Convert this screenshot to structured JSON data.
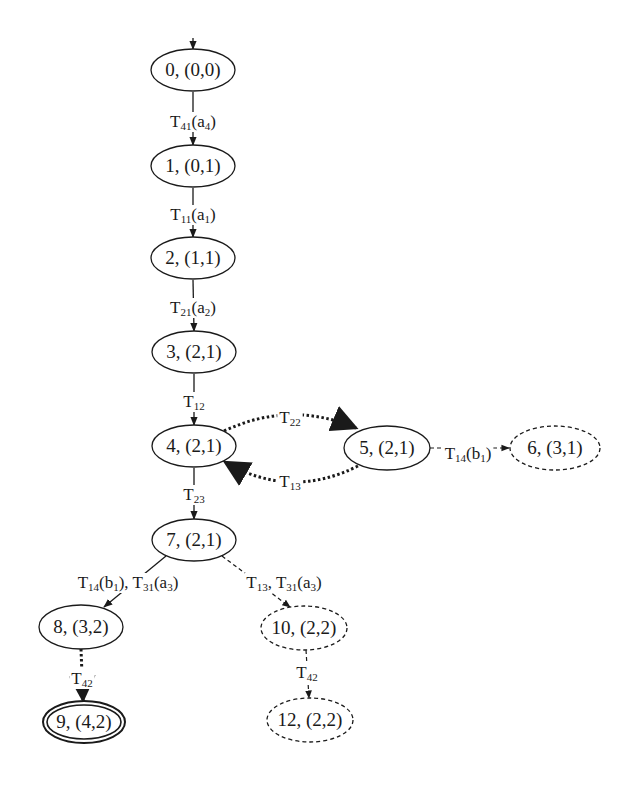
{
  "title": "",
  "colors": {
    "ink": "#1a1a1a",
    "background": "#ffffff"
  },
  "nodes": [
    {
      "id": "0",
      "label": "0, (0,0)",
      "style": "solid",
      "initial": true,
      "final": false
    },
    {
      "id": "1",
      "label": "1, (0,1)",
      "style": "solid",
      "initial": false,
      "final": false
    },
    {
      "id": "2",
      "label": "2, (1,1)",
      "style": "solid",
      "initial": false,
      "final": false
    },
    {
      "id": "3",
      "label": "3, (2,1)",
      "style": "solid",
      "initial": false,
      "final": false
    },
    {
      "id": "4",
      "label": "4, (2,1)",
      "style": "solid",
      "initial": false,
      "final": false
    },
    {
      "id": "5",
      "label": "5, (2,1)",
      "style": "solid",
      "initial": false,
      "final": false
    },
    {
      "id": "6",
      "label": "6, (3,1)",
      "style": "dashed",
      "initial": false,
      "final": false
    },
    {
      "id": "7",
      "label": "7, (2,1)",
      "style": "solid",
      "initial": false,
      "final": false
    },
    {
      "id": "8",
      "label": "8, (3,2)",
      "style": "solid",
      "initial": false,
      "final": false
    },
    {
      "id": "9",
      "label": "9, (4,2)",
      "style": "double",
      "initial": false,
      "final": true
    },
    {
      "id": "10",
      "label": "10, (2,2)",
      "style": "dashed",
      "initial": false,
      "final": false
    },
    {
      "id": "12",
      "label": "12, (2,2)",
      "style": "dashed",
      "initial": false,
      "final": false
    }
  ],
  "edges": [
    {
      "from": "0",
      "to": "1",
      "style": "solid",
      "label": [
        [
          "T",
          ""
        ],
        [
          "41",
          "sub"
        ],
        [
          "(a",
          ""
        ],
        [
          "4",
          "sub"
        ],
        [
          ")",
          ""
        ]
      ]
    },
    {
      "from": "1",
      "to": "2",
      "style": "solid",
      "label": [
        [
          "T",
          ""
        ],
        [
          "11",
          "sub"
        ],
        [
          "(a",
          ""
        ],
        [
          "1",
          "sub"
        ],
        [
          ")",
          ""
        ]
      ]
    },
    {
      "from": "2",
      "to": "3",
      "style": "solid",
      "label": [
        [
          "T",
          ""
        ],
        [
          "21",
          "sub"
        ],
        [
          "(a",
          ""
        ],
        [
          "2",
          "sub"
        ],
        [
          ")",
          ""
        ]
      ]
    },
    {
      "from": "3",
      "to": "4",
      "style": "solid",
      "label": [
        [
          "T",
          ""
        ],
        [
          "12",
          "sub"
        ]
      ]
    },
    {
      "from": "4",
      "to": "5",
      "style": "dotted",
      "label": [
        [
          "T",
          ""
        ],
        [
          "22",
          "sub"
        ]
      ]
    },
    {
      "from": "5",
      "to": "4",
      "style": "dotted",
      "label": [
        [
          "T",
          ""
        ],
        [
          "13",
          "sub"
        ]
      ]
    },
    {
      "from": "5",
      "to": "6",
      "style": "dashed",
      "label": [
        [
          "T",
          ""
        ],
        [
          "14",
          "sub"
        ],
        [
          "(b",
          ""
        ],
        [
          "1",
          "sub"
        ],
        [
          ")",
          ""
        ]
      ]
    },
    {
      "from": "4",
      "to": "7",
      "style": "solid",
      "label": [
        [
          "T",
          ""
        ],
        [
          "23",
          "sub"
        ]
      ]
    },
    {
      "from": "7",
      "to": "8",
      "style": "solid",
      "label": [
        [
          "T",
          ""
        ],
        [
          "14",
          "sub"
        ],
        [
          "(b",
          ""
        ],
        [
          "1",
          "sub"
        ],
        [
          "), T",
          ""
        ],
        [
          "31",
          "sub"
        ],
        [
          "(a",
          ""
        ],
        [
          "3",
          "sub"
        ],
        [
          ")",
          ""
        ]
      ]
    },
    {
      "from": "7",
      "to": "10",
      "style": "dashed",
      "label": [
        [
          "T",
          ""
        ],
        [
          "13",
          "sub"
        ],
        [
          ", T",
          ""
        ],
        [
          "31",
          "sub"
        ],
        [
          "(a",
          ""
        ],
        [
          "3",
          "sub"
        ],
        [
          ")",
          ""
        ]
      ]
    },
    {
      "from": "8",
      "to": "9",
      "style": "dotted",
      "label": [
        [
          "T",
          ""
        ],
        [
          "42",
          "sub"
        ]
      ]
    },
    {
      "from": "10",
      "to": "12",
      "style": "dashed",
      "label": [
        [
          "T",
          ""
        ],
        [
          "42",
          "sub"
        ]
      ]
    }
  ]
}
